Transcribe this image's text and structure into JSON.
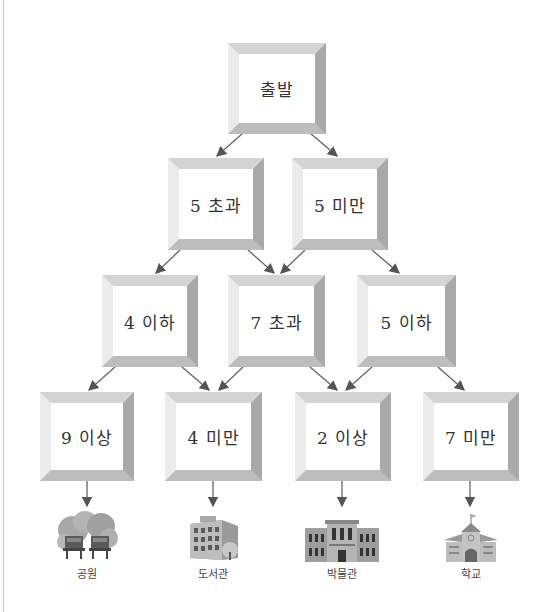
{
  "diagram": {
    "type": "flowchart",
    "start": {
      "id": "start",
      "label": "출발"
    },
    "rows": [
      [
        {
          "id": "n_gt5",
          "label": "5 초과"
        },
        {
          "id": "n_lt5",
          "label": "5 미만"
        }
      ],
      [
        {
          "id": "n_le4",
          "label": "4 이하"
        },
        {
          "id": "n_gt7",
          "label": "7 초과"
        },
        {
          "id": "n_le5",
          "label": "5 이하"
        }
      ],
      [
        {
          "id": "n_ge9",
          "label": "9 이상"
        },
        {
          "id": "n_lt4",
          "label": "4 미만"
        },
        {
          "id": "n_ge2",
          "label": "2 이상"
        },
        {
          "id": "n_lt7",
          "label": "7 미만"
        }
      ]
    ],
    "edges": [
      [
        "start",
        "n_gt5"
      ],
      [
        "start",
        "n_lt5"
      ],
      [
        "n_gt5",
        "n_le4"
      ],
      [
        "n_gt5",
        "n_gt7"
      ],
      [
        "n_lt5",
        "n_gt7"
      ],
      [
        "n_lt5",
        "n_le5"
      ],
      [
        "n_le4",
        "n_ge9"
      ],
      [
        "n_le4",
        "n_lt4"
      ],
      [
        "n_gt7",
        "n_lt4"
      ],
      [
        "n_gt7",
        "n_ge2"
      ],
      [
        "n_le5",
        "n_ge2"
      ],
      [
        "n_le5",
        "n_lt7"
      ],
      [
        "n_ge9",
        "park"
      ],
      [
        "n_lt4",
        "library"
      ],
      [
        "n_ge2",
        "museum"
      ],
      [
        "n_lt7",
        "school"
      ]
    ],
    "destinations": [
      {
        "id": "park",
        "label": "공원",
        "icon": "park-icon"
      },
      {
        "id": "library",
        "label": "도서관",
        "icon": "library-icon"
      },
      {
        "id": "museum",
        "label": "박물관",
        "icon": "museum-icon"
      },
      {
        "id": "school",
        "label": "학교",
        "icon": "school-icon"
      }
    ]
  },
  "colors": {
    "arrow": "#555555",
    "box_frame": "#c0c0c0",
    "text": "#333333"
  }
}
